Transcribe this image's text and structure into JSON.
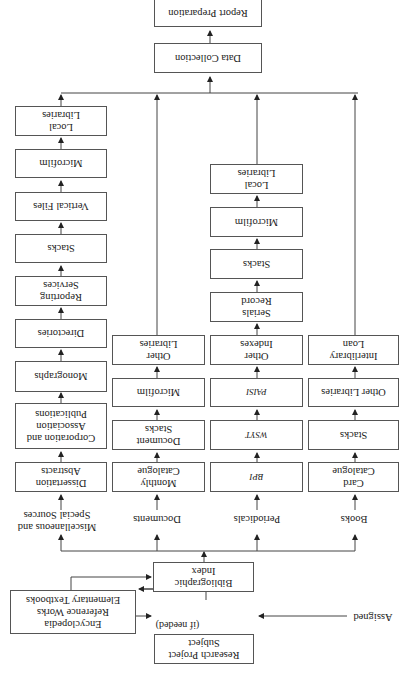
{
  "diagram": {
    "orientation": "rotated 180 degrees",
    "start": {
      "selected_label": "Selected",
      "assigned_label": "Assigned",
      "research_project": "Research Project\nSubject",
      "if_needed": "(if needed)",
      "encyclopedia": "Encyclopedia\nReference Works\nElementary Textbooks",
      "bibliographic_index": "Bibliographic\nIndex"
    },
    "columns": [
      {
        "source": "Miscellaneous and\nSpecial Sources",
        "steps": [
          "Dissertation\nAbstracts",
          "Corporation and\nAssociation\nPublications",
          "Monographs",
          "Directories",
          "Reporting\nServices",
          "Stacks",
          "Vertical Files",
          "Microfilm",
          "Local\nLibraries"
        ]
      },
      {
        "source": "Documents",
        "steps": [
          "Monthly\nCatalogue",
          "Document\nStacks",
          "Microfilm",
          "Other\nLibraries"
        ]
      },
      {
        "source": "Periodicals",
        "steps": [
          "BPI",
          "WSYT",
          "PAISI",
          "Other\nIndexes",
          "Serials\nRecord",
          "Stacks",
          "Microfilm",
          "Local\nLibraries"
        ]
      },
      {
        "source": "Books",
        "steps": [
          "Card\nCatalogue",
          "Stacks",
          "Other Libraries",
          "Interlibrary\nLoan"
        ]
      }
    ],
    "end": {
      "data_collection": "Data Collection",
      "report_preparation": "Report Preparation"
    }
  }
}
